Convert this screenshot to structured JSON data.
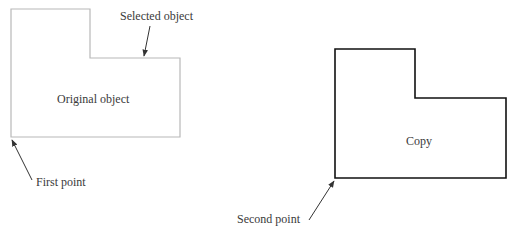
{
  "diagram": {
    "type": "copy-operation-illustration",
    "original": {
      "label": "Original object",
      "stroke": "#b8b8b8",
      "points": [
        [
          11,
          9
        ],
        [
          90,
          9
        ],
        [
          90,
          58
        ],
        [
          180,
          58
        ],
        [
          180,
          137
        ],
        [
          11,
          137
        ]
      ]
    },
    "copy": {
      "label": "Copy",
      "stroke": "#111111",
      "points": [
        [
          335,
          49
        ],
        [
          415,
          49
        ],
        [
          415,
          98
        ],
        [
          506,
          98
        ],
        [
          506,
          178
        ],
        [
          335,
          178
        ]
      ]
    },
    "annotations": {
      "selected_object": "Selected object",
      "first_point": "First point",
      "second_point": "Second point"
    },
    "arrow_color": "#333333"
  }
}
